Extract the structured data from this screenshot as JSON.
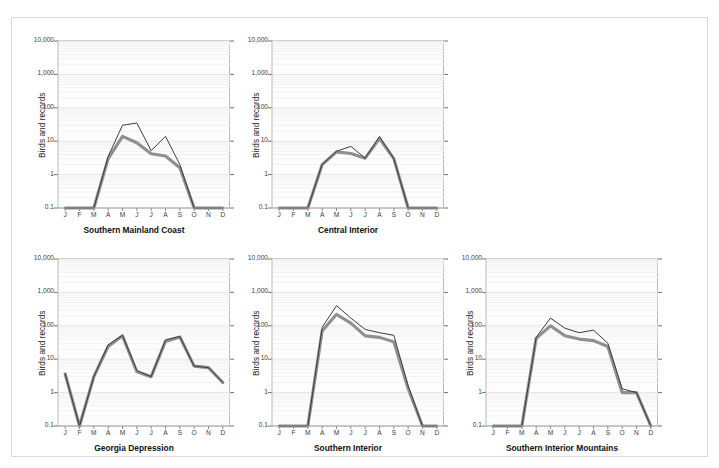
{
  "chart_data": {
    "type": "line",
    "title": "",
    "ylabel": "Birds and records",
    "xlabel": "",
    "log_y": true,
    "ylim": [
      0.1,
      10000
    ],
    "ytick_labels": [
      "10,000",
      "1,000",
      "100",
      "10",
      "1",
      "0.1"
    ],
    "ytick_values": [
      10000,
      1000,
      100,
      10,
      1,
      0.1
    ],
    "categories": [
      "J",
      "F",
      "M",
      "A",
      "M",
      "J",
      "J",
      "A",
      "S",
      "O",
      "N",
      "D"
    ],
    "grid": "minor-horizontal-log",
    "legend_position": "none",
    "series_names": [
      "records",
      "birds"
    ],
    "series_colors": [
      "#3c3c3c",
      "#8f8f8f"
    ],
    "panels": [
      {
        "name": "Southern Mainland Coast",
        "row": 0,
        "col": 0,
        "series": [
          {
            "name": "records",
            "values": [
              0.1,
              0.1,
              0.1,
              3.5,
              30,
              35,
              5.2,
              14,
              2.0,
              0.1,
              0.1,
              0.1
            ]
          },
          {
            "name": "birds",
            "values": [
              0.1,
              0.1,
              0.1,
              3.0,
              14,
              9.0,
              4.2,
              3.6,
              1.6,
              0.1,
              0.1,
              0.1
            ]
          }
        ]
      },
      {
        "name": "Central Interior",
        "row": 0,
        "col": 1,
        "series": [
          {
            "name": "records",
            "values": [
              0.1,
              0.1,
              0.1,
              2.0,
              5.0,
              7.0,
              3.1,
              14,
              3.0,
              0.1,
              0.1,
              0.1
            ]
          },
          {
            "name": "birds",
            "values": [
              0.1,
              0.1,
              0.1,
              2.0,
              4.8,
              4.3,
              3.1,
              12,
              3.0,
              0.1,
              0.1,
              0.1
            ]
          }
        ]
      },
      {
        "name": "Georgia Depression",
        "row": 1,
        "col": 0,
        "series": [
          {
            "name": "records",
            "values": [
              3.6,
              0.1,
              3.0,
              27,
              52,
              4.6,
              3.0,
              38,
              48,
              6.2,
              5.6,
              2.0
            ]
          },
          {
            "name": "birds",
            "values": [
              3.6,
              0.1,
              3.0,
              24,
              50,
              4.2,
              3.0,
              34,
              46,
              6.2,
              5.6,
              2.0
            ]
          }
        ]
      },
      {
        "name": "Southern Interior",
        "row": 1,
        "col": 1,
        "series": [
          {
            "name": "records",
            "values": [
              0.1,
              0.1,
              0.1,
              90,
              400,
              170,
              78,
              62,
              52,
              1.6,
              0.1,
              0.1
            ]
          },
          {
            "name": "birds",
            "values": [
              0.1,
              0.1,
              0.1,
              70,
              220,
              120,
              50,
              45,
              33,
              1.3,
              0.1,
              0.1
            ]
          }
        ]
      },
      {
        "name": "Southern Interior Mountains",
        "row": 1,
        "col": 2,
        "series": [
          {
            "name": "records",
            "values": [
              0.1,
              0.1,
              0.1,
              45,
              170,
              85,
              62,
              74,
              30,
              1.3,
              1.0,
              0.1
            ]
          },
          {
            "name": "birds",
            "values": [
              0.1,
              0.1,
              0.1,
              42,
              100,
              50,
              40,
              36,
              24,
              1.0,
              1.0,
              0.1
            ]
          }
        ]
      }
    ]
  }
}
